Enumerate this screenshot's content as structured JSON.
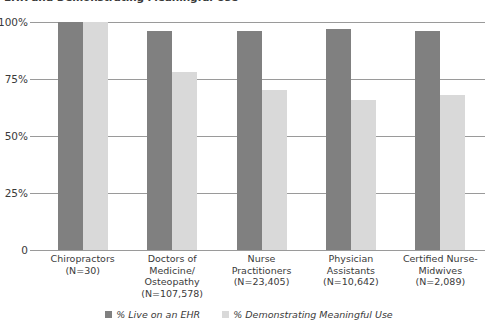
{
  "chart_data": {
    "type": "bar",
    "title": "EHR and Demonstrating Meaningful Use",
    "xlabel": "",
    "ylabel": "",
    "ylim": [
      0,
      100
    ],
    "ytick_labels": [
      "100%",
      "75%",
      "50%",
      "25%",
      "0"
    ],
    "ytick_values": [
      100,
      75,
      50,
      25,
      0
    ],
    "grid": true,
    "legend_position": "bottom",
    "categories": [
      "Chiropractors",
      "Doctors of Medicine/ Osteopathy",
      "Nurse Practitioners",
      "Physician Assistants",
      "Certified Nurse-Midwives"
    ],
    "category_labels": [
      {
        "name": "Chiropractors",
        "n": "(N=30)"
      },
      {
        "name": "Doctors of Medicine/ Osteopathy",
        "n": "(N=107,578)"
      },
      {
        "name": "Nurse Practitioners",
        "n": "(N=23,405)"
      },
      {
        "name": "Physician Assistants",
        "n": "(N=10,642)"
      },
      {
        "name": "Certified Nurse-Midwives",
        "n": "(N=2,089)"
      }
    ],
    "series": [
      {
        "name": "% Live on an EHR",
        "color": "#808080",
        "values": [
          100,
          96,
          96,
          97,
          96
        ]
      },
      {
        "name": "% Demonstrating Meaningful Use",
        "color": "#d9d9d9",
        "values": [
          100,
          78,
          70,
          66,
          68
        ]
      }
    ]
  },
  "legend": {
    "items": [
      {
        "label": "% Live on an EHR",
        "color": "#808080"
      },
      {
        "label": "% Demonstrating Meaningful Use",
        "color": "#d9d9d9"
      }
    ]
  },
  "colors": {
    "series_dark": "#808080",
    "series_light": "#d9d9d9",
    "axis": "#9a9a9a",
    "text": "#3a3a3a",
    "background": "#ffffff"
  }
}
